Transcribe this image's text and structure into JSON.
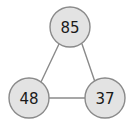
{
  "graph": {
    "type": "undirected-weighted-node-graph",
    "background_color": "#ffffff",
    "node_fill_color": "#e3e3e3",
    "node_stroke_color": "#8a8a8a",
    "node_label_color": "#1a1a1a",
    "edge_color": "#8a8a8a",
    "node_radius": 20,
    "nodes": [
      {
        "id": "top",
        "label": "85",
        "cx": 70,
        "cy": 27
      },
      {
        "id": "bottom-left",
        "label": "48",
        "cx": 29,
        "cy": 98
      },
      {
        "id": "bottom-right",
        "label": "37",
        "cx": 105,
        "cy": 98
      }
    ],
    "edges": [
      {
        "id": "edge-top-bottomleft",
        "from": "top",
        "to": "bottom-left",
        "x1": 59,
        "y1": 44,
        "x2": 41,
        "y2": 82
      },
      {
        "id": "edge-top-bottomright",
        "from": "top",
        "to": "bottom-right",
        "x1": 82,
        "y1": 44,
        "x2": 95,
        "y2": 82
      },
      {
        "id": "edge-bottomleft-bottomright",
        "from": "bottom-left",
        "to": "bottom-right",
        "x1": 49,
        "y1": 98,
        "x2": 85,
        "y2": 98
      }
    ]
  }
}
